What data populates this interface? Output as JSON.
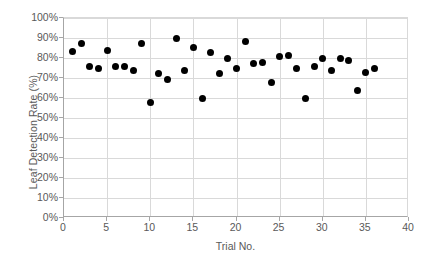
{
  "chart_data": {
    "type": "scatter",
    "title": "",
    "xlabel": "Trial No.",
    "ylabel": "Leaf Detection Rate (%)",
    "xlim": [
      0,
      40
    ],
    "ylim": [
      0,
      100
    ],
    "grid": true,
    "legend": false,
    "marker": "filled-circle",
    "marker_color": "#000000",
    "x_ticks": [
      "0",
      "5",
      "10",
      "15",
      "20",
      "25",
      "30",
      "35",
      "40"
    ],
    "x_tick_values": [
      0,
      5,
      10,
      15,
      20,
      25,
      30,
      35,
      40
    ],
    "y_ticks": [
      "0%",
      "10%",
      "20%",
      "30%",
      "40%",
      "50%",
      "60%",
      "70%",
      "80%",
      "90%",
      "100%"
    ],
    "y_tick_values": [
      0,
      10,
      20,
      30,
      40,
      50,
      60,
      70,
      80,
      90,
      100
    ],
    "x": [
      1,
      2,
      3,
      4,
      5,
      6,
      7,
      8,
      9,
      10,
      11,
      12,
      13,
      14,
      15,
      16,
      17,
      18,
      19,
      20,
      21,
      22,
      23,
      24,
      25,
      26,
      27,
      28,
      29,
      30,
      31,
      32,
      33,
      34,
      35,
      36
    ],
    "y": [
      83.5,
      87.5,
      76.0,
      75.0,
      84.0,
      76.0,
      76.0,
      74.0,
      87.5,
      58.0,
      72.5,
      69.5,
      90.0,
      74.0,
      85.5,
      60.0,
      83.0,
      72.5,
      80.0,
      75.0,
      88.5,
      77.5,
      78.0,
      68.0,
      81.0,
      81.5,
      75.0,
      60.0,
      76.0,
      80.0,
      74.0,
      80.0,
      79.0,
      64.0,
      73.0,
      75.0
    ]
  },
  "axes": {
    "x_title": "Trial No.",
    "y_title": "Leaf Detection Rate (%)"
  }
}
